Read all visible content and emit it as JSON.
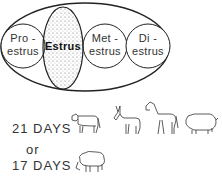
{
  "cycle": {
    "phases": [
      {
        "line1": "Pro -",
        "line2": "estrus"
      },
      {
        "line1": "Estrus",
        "line2": ""
      },
      {
        "line1": "Met -",
        "line2": "estrus"
      },
      {
        "line1": "Di -",
        "line2": "estrus"
      }
    ],
    "highlighted_phase": "Estrus"
  },
  "durations": {
    "first": "21 DAYS",
    "connector": "or",
    "second": "17 DAYS"
  },
  "animals": {
    "21_days": [
      "cow-icon",
      "donkey-icon",
      "horse-icon",
      "pig-icon"
    ],
    "17_days": [
      "sheep-icon"
    ]
  }
}
